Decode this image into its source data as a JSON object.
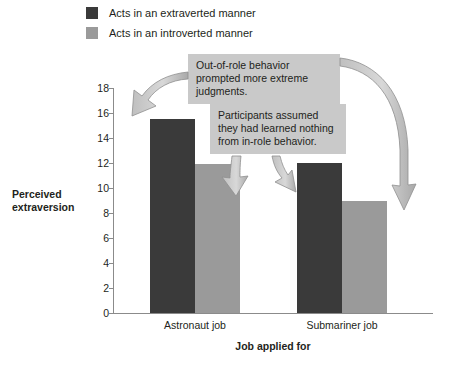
{
  "legend": {
    "items": [
      {
        "label": "Acts in an extraverted manner",
        "color": "#3a3a3a",
        "name": "legend-extraverted"
      },
      {
        "label": "Acts in an introverted manner",
        "color": "#9a9a9a",
        "name": "legend-introverted"
      }
    ]
  },
  "annotations": [
    {
      "id": "callout-1",
      "text": "Out-of-role behavior prompted more extreme judgments."
    },
    {
      "id": "callout-2",
      "text": "Participants assumed they had learned nothing from in-role behavior."
    }
  ],
  "axis": {
    "y_title_line1": "Perceived",
    "y_title_line2": "extraversion",
    "x_title": "Job applied for"
  },
  "chart_data": {
    "type": "bar",
    "title": "",
    "xlabel": "Job applied for",
    "ylabel": "Perceived extraversion",
    "ylim": [
      0,
      18
    ],
    "yticks": [
      0,
      2,
      4,
      6,
      8,
      10,
      12,
      14,
      16,
      18
    ],
    "ytick_labels": [
      "0",
      "2",
      "4",
      "6",
      "8",
      "10",
      "12",
      "14",
      "16",
      "18"
    ],
    "grid": false,
    "legend_position": "top-left",
    "categories": [
      "Astronaut job",
      "Submariner job"
    ],
    "series": [
      {
        "name": "Acts in an extraverted manner",
        "color": "#3a3a3a",
        "values": [
          15.5,
          12.0
        ]
      },
      {
        "name": "Acts in an introverted manner",
        "color": "#9a9a9a",
        "values": [
          11.9,
          9.0
        ]
      }
    ]
  }
}
